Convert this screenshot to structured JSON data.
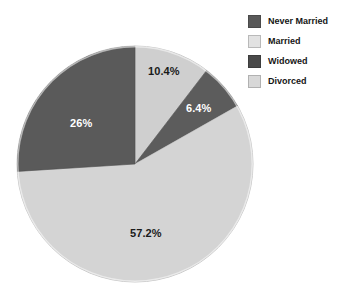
{
  "chart_data": {
    "type": "pie",
    "title": "",
    "subtitle": "",
    "xlabel": "",
    "ylabel": "",
    "grid": false,
    "legend_position": "top-right",
    "start_angle_deg": 0,
    "direction": "clockwise",
    "categories": [
      "Never Married",
      "Married",
      "Widowed",
      "Divorced"
    ],
    "values": [
      10.4,
      57.2,
      6.4,
      26.0
    ],
    "units": "percent",
    "slices": [
      {
        "label": "Never Married",
        "value": 10.4,
        "data_label": "10.4%",
        "color": "#cfcfcf",
        "text_color": "#1a1a1a",
        "order_clockwise": 1
      },
      {
        "label": "Widowed",
        "value": 6.4,
        "data_label": "6.4%",
        "color": "#5c5c5c",
        "text_color": "#ffffff",
        "order_clockwise": 2
      },
      {
        "label": "Married",
        "value": 57.2,
        "data_label": "57.2%",
        "color": "#d4d4d4",
        "text_color": "#1a1a1a",
        "order_clockwise": 3
      },
      {
        "label": "Divorced",
        "value": 26.0,
        "data_label": "26%",
        "color": "#5a5a5a",
        "text_color": "#ffffff",
        "order_clockwise": 4
      }
    ],
    "annotations": []
  },
  "legend": {
    "items": [
      {
        "label": "Never Married",
        "color": "#595959"
      },
      {
        "label": "Married",
        "color": "#e2e2e2"
      },
      {
        "label": "Widowed",
        "color": "#4a4a4a"
      },
      {
        "label": "Divorced",
        "color": "#d8d8d8"
      }
    ]
  },
  "colors": {
    "background": "#ffffff",
    "pie_outline": "#b8b8b8",
    "dark_slice": "#5a5a5a",
    "light_slice": "#d4d4d4"
  }
}
